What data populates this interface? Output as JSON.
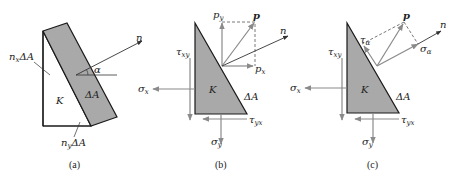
{
  "figure": {
    "panels": [
      {
        "caption": "(a)",
        "labels": {
          "n": "n",
          "alpha": "α",
          "delta_a": "ΔA",
          "k": "K",
          "nx_delta_a_main": "n",
          "nx_delta_a_sub": "x",
          "nx_delta_a_tail": "ΔA",
          "ny_delta_a_main": "n",
          "ny_delta_a_sub": "y",
          "ny_delta_a_tail": "ΔA"
        }
      },
      {
        "caption": "(b)",
        "labels": {
          "p": "p",
          "n": "n",
          "py_main": "p",
          "py_sub": "y",
          "px_main": "p",
          "px_sub": "x",
          "tau_xy_main": "τ",
          "tau_xy_sub": "xy",
          "sigma_x_main": "σ",
          "sigma_x_sub": "x",
          "k": "K",
          "delta_a": "ΔA",
          "tau_yx_main": "τ",
          "tau_yx_sub": "yx",
          "sigma_y_main": "σ",
          "sigma_y_sub": "y"
        }
      },
      {
        "caption": "(c)",
        "labels": {
          "p": "p",
          "n": "n",
          "tau_alpha_main": "τ",
          "tau_alpha_sub": "α",
          "sigma_alpha_main": "σ",
          "sigma_alpha_sub": "α",
          "tau_xy_main": "τ",
          "tau_xy_sub": "xy",
          "sigma_x_main": "σ",
          "sigma_x_sub": "x",
          "k": "K",
          "delta_a": "ΔA",
          "tau_yx_main": "τ",
          "tau_yx_sub": "yx",
          "sigma_y_main": "σ",
          "sigma_y_sub": "y"
        }
      }
    ],
    "colors": {
      "shaded_face": "#a9a9a9",
      "outline": "#1a1a1a",
      "force_arrow": "#8a8a8a",
      "text": "#222222"
    }
  }
}
